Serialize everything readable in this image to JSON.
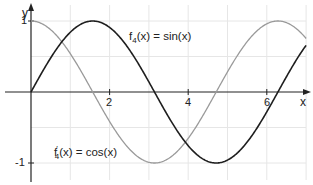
{
  "chart_data": {
    "type": "line",
    "title": "",
    "xlabel": "x",
    "ylabel": "y",
    "xlim": [
      0,
      7.1
    ],
    "ylim": [
      -1.2,
      1.25
    ],
    "grid": true,
    "x_ticks": [
      "2",
      "4",
      "6"
    ],
    "y_ticks": [
      "1",
      "-1"
    ],
    "series": [
      {
        "name": "f4(x) = sin(x)",
        "function": "sin(x)",
        "color": "#222222",
        "x": [
          0,
          1.5708,
          3.1416,
          4.7124,
          6.2832,
          7.0
        ],
        "y": [
          0,
          1,
          0,
          -1,
          0,
          0.657
        ]
      },
      {
        "name": "f4'(x) = cos(x)",
        "function": "cos(x)",
        "color": "#999999",
        "x": [
          0,
          1.5708,
          3.1416,
          4.7124,
          6.2832,
          7.0
        ],
        "y": [
          1,
          0,
          -1,
          0,
          1,
          0.754
        ]
      }
    ],
    "annotations": [
      {
        "text_main": "f",
        "sub": "4",
        "rest": "(x) = sin(x)",
        "near": "sin curve"
      },
      {
        "text_main": "f",
        "sup": "′",
        "sub": "4",
        "rest": "(x) = cos(x)",
        "near": "cos curve"
      }
    ]
  },
  "labels": {
    "x_axis": "x",
    "y_axis": "y",
    "tick_x2": "2",
    "tick_x4": "4",
    "tick_x6": "6",
    "tick_y1": "1",
    "tick_ym1": "-1",
    "sin_f": "f",
    "sin_sub": "4",
    "sin_rest": "(x) = sin(x)",
    "cos_f": "f",
    "cos_sup": "′",
    "cos_sub": "4",
    "cos_rest": "(x) = cos(x)"
  }
}
